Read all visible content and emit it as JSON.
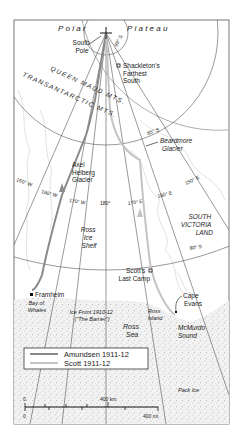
{
  "map": {
    "title": "Race to the South Pole",
    "regions": {
      "polar": "Polar",
      "plateau": "Plateau",
      "queen_maud": "QUEEN MAUD MTS.",
      "transantarctic": "TRANSANTARCTIC MTS.",
      "south_victoria_1": "SOUTH",
      "south_victoria_2": "VICTORIA",
      "south_victoria_3": "LAND",
      "ross_ice_1": "Ross",
      "ross_ice_2": "Ice",
      "ross_ice_3": "Shelf",
      "ross_sea_1": "Ross",
      "ross_sea_2": "Sea",
      "mcmurdo_1": "McMurdo",
      "mcmurdo_2": "Sound",
      "pack_ice": "Pack Ice",
      "ice_front_1": "Ice Front 1910-12",
      "ice_front_2": "(\"The Barrier\")"
    },
    "places": {
      "south_pole_1": "South",
      "south_pole_2": "Pole",
      "shackleton_1": "Shackleton's",
      "shackleton_2": "Farthest",
      "shackleton_3": "South",
      "axel_1": "Axel",
      "axel_2": "Heiberg",
      "axel_3": "Glacier",
      "beardmore_1": "Beardmore",
      "beardmore_2": "Glacier",
      "scott_camp_1": "Scott's",
      "scott_camp_2": "Last Camp",
      "framheim": "Framheim",
      "bay_1": "Bay of",
      "bay_2": "Whales",
      "cape_1": "Cape",
      "cape_2": "Evans",
      "ross_island_1": "Ross",
      "ross_island_2": "Island"
    },
    "graticule": {
      "lat_89": "89° S",
      "lat_85": "85° S",
      "lat_80": "80° S",
      "lon_150w": "150° W",
      "lon_160w": "160° W",
      "lon_170w": "170° W",
      "lon_180": "180°",
      "lon_170e": "170° E",
      "lon_160e": "160° E",
      "lon_150e": "150° E"
    },
    "legend": {
      "items": [
        {
          "label": "Amundsen 1911-12",
          "color": "#8a8a8a"
        },
        {
          "label": "Scott 1911-12",
          "color": "#c4c4c4"
        }
      ]
    },
    "scale": {
      "km_zero": "0",
      "km_label": "400 km",
      "mi_zero": "0",
      "mi_label": "400 mi"
    },
    "colors": {
      "frame": "#555555",
      "graticule": "#555555",
      "amundsen": "#8a8a8a",
      "scott": "#c4c4c4",
      "coast": "#c8c8c8"
    }
  }
}
